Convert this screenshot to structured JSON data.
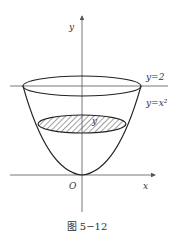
{
  "figure": {
    "caption": "图 5−12",
    "axes": {
      "x_label": "x",
      "y_label": "y",
      "origin_label": "O"
    },
    "curves": {
      "line_label": "y=2",
      "parabola_label": "y=x²"
    },
    "section": {
      "label": "y",
      "fill": "hatched"
    },
    "colors": {
      "stroke": "#222222",
      "axis": "#555555",
      "text": "#333333",
      "background": "#ffffff"
    }
  }
}
